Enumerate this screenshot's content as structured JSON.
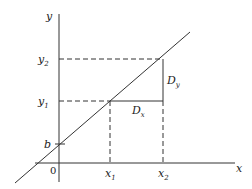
{
  "diagram": {
    "type": "linear-function-slope",
    "axes": {
      "x_label": "x",
      "y_label": "y",
      "origin_label": "0"
    },
    "intercept_label": "b",
    "points": {
      "x1": {
        "label": "x",
        "sub": "1"
      },
      "x2": {
        "label": "x",
        "sub": "2"
      },
      "y1": {
        "label": "y",
        "sub": "1"
      },
      "y2": {
        "label": "y",
        "sub": "2"
      }
    },
    "deltas": {
      "dx": {
        "label": "D",
        "sub": "x"
      },
      "dy": {
        "label": "D",
        "sub": "y"
      }
    },
    "colors": {
      "stroke": "#333333",
      "background": "#ffffff"
    }
  }
}
